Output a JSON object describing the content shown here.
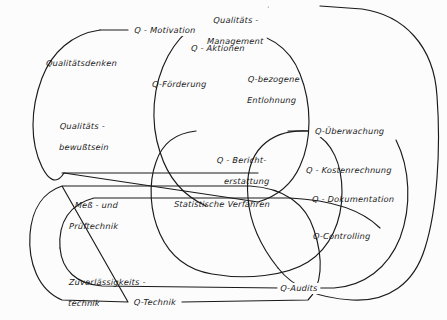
{
  "diagram": {
    "type": "euler-venn-diagram",
    "language": "de",
    "background_color": "#fcfcfc",
    "stroke_color": "#1a1a1a",
    "sets": [
      {
        "id": "q-management",
        "label": "Qualitäts -\nManagement",
        "label_line1": "Qualitäts -",
        "label_line2": "Management",
        "role": "outermost-set"
      },
      {
        "id": "q-motivation",
        "label": "Q - Motivation",
        "role": "left-set"
      },
      {
        "id": "q-ueberwachung",
        "label": "Q-Überwachung",
        "role": "right-set"
      },
      {
        "id": "q-technik",
        "label": "Q-Technik",
        "role": "bottom-left-set"
      },
      {
        "id": "q-audits",
        "label": "Q-Audits",
        "role": "bottom-right-set"
      }
    ],
    "members": [
      {
        "id": "qualitaetsdenken",
        "label": "Qualitätsdenken"
      },
      {
        "id": "qualitaetsbewusstsein",
        "label_line1": "Qualitäts -",
        "label_line2": "bewußtsein"
      },
      {
        "id": "q-aktionen",
        "label": "Q - Aktionen"
      },
      {
        "id": "q-foerderung",
        "label": "Q-Förderung"
      },
      {
        "id": "q-bezogene-entlohnung",
        "label_line1": "Q-bezogene",
        "label_line2": "Entlohnung"
      },
      {
        "id": "q-berichterstattung",
        "label_line1": "Q - Bericht-",
        "label_line2": "erstattung"
      },
      {
        "id": "q-kostenrechnung",
        "label": "Q - Kostenrechnung"
      },
      {
        "id": "q-dokumentation",
        "label": "Q - Dokumentation"
      },
      {
        "id": "q-controlling",
        "label": "Q-Controlling"
      },
      {
        "id": "statistische-verfahren",
        "label": "Statistische Verfahren"
      },
      {
        "id": "mess-und-pruef",
        "label_line1": "Meß - und",
        "label_line2": "Prüftechnik"
      },
      {
        "id": "zuverlaessigkeit",
        "label_line1": "Zuverlässigkeits -",
        "label_line2": "technik"
      }
    ]
  }
}
